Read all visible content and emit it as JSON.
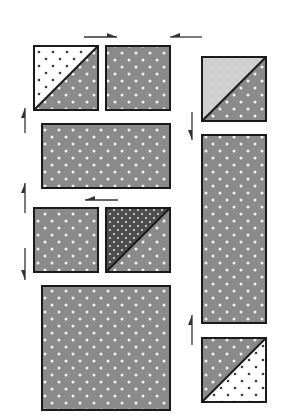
{
  "diagram": {
    "title": "",
    "colors": {
      "background": "#ffffff",
      "medium_gray_fabric": "#8a8a8a",
      "dark_gray_fabric": "#4e4e4e",
      "light_gray_fabric": "#cfcfcf",
      "white_fabric": "#ffffff",
      "dot_light": "#f2f2f2",
      "dot_dark": "#3a3a3a",
      "outline": "#1a1a1a",
      "arrow": "#333333"
    },
    "pieces": [
      {
        "id": "hst-top-left",
        "type": "half-square-triangle",
        "x": 34,
        "y": 46,
        "w": 64,
        "h": 64,
        "upper": "white-dark-dots",
        "lower": "medium-light-dots"
      },
      {
        "id": "square-top-mid",
        "type": "square",
        "x": 106,
        "y": 46,
        "w": 64,
        "h": 64,
        "fabric": "medium-light-dots"
      },
      {
        "id": "rect-middle",
        "type": "rectangle",
        "x": 42,
        "y": 124,
        "w": 128,
        "h": 64,
        "fabric": "medium-light-dots"
      },
      {
        "id": "square-row3-left",
        "type": "square",
        "x": 34,
        "y": 208,
        "w": 64,
        "h": 64,
        "fabric": "medium-light-dots"
      },
      {
        "id": "hst-row3-right",
        "type": "half-square-triangle",
        "x": 106,
        "y": 208,
        "w": 64,
        "h": 64,
        "upper": "dark-light-dots",
        "lower": "medium-light-dots"
      },
      {
        "id": "square-large",
        "type": "square",
        "x": 42,
        "y": 286,
        "w": 128,
        "h": 124,
        "fabric": "medium-light-dots"
      },
      {
        "id": "hst-top-right",
        "type": "half-square-triangle",
        "x": 202,
        "y": 57,
        "w": 64,
        "h": 64,
        "upper": "light-gray",
        "lower": "medium-light-dots"
      },
      {
        "id": "rect-tall",
        "type": "rectangle",
        "x": 202,
        "y": 135,
        "w": 64,
        "h": 188,
        "fabric": "medium-light-dots"
      },
      {
        "id": "hst-bottom-right",
        "type": "half-square-triangle-reversed",
        "x": 202,
        "y": 338,
        "w": 64,
        "h": 64,
        "upper": "medium-light-dots",
        "lower": "white-dark-dots"
      }
    ],
    "arrows": [
      {
        "id": "arrow-top-right",
        "direction": "right",
        "x1": 84,
        "y1": 37,
        "x2": 117,
        "y2": 37
      },
      {
        "id": "arrow-top-left",
        "direction": "left",
        "x1": 202,
        "y1": 37,
        "x2": 170,
        "y2": 37
      },
      {
        "id": "arrow-left-up-1",
        "direction": "up",
        "x1": 25,
        "y1": 133,
        "x2": 25,
        "y2": 108
      },
      {
        "id": "arrow-left-up-2",
        "direction": "up",
        "x1": 25,
        "y1": 213,
        "x2": 25,
        "y2": 183
      },
      {
        "id": "arrow-left-down",
        "direction": "down",
        "x1": 25,
        "y1": 248,
        "x2": 25,
        "y2": 280
      },
      {
        "id": "arrow-mid-left",
        "direction": "left",
        "x1": 118,
        "y1": 200,
        "x2": 85,
        "y2": 200
      },
      {
        "id": "arrow-right-down",
        "direction": "down",
        "x1": 192,
        "y1": 112,
        "x2": 192,
        "y2": 140
      },
      {
        "id": "arrow-right-up",
        "direction": "up",
        "x1": 192,
        "y1": 345,
        "x2": 192,
        "y2": 315
      }
    ]
  }
}
